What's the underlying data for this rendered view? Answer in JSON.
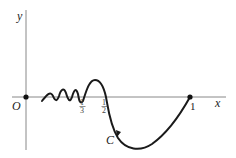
{
  "diagram": {
    "axes": {
      "x_label": "x",
      "y_label": "y",
      "origin_label": "O",
      "axis_color": "#888888"
    },
    "ticks": [
      {
        "num": "1",
        "den": "3"
      },
      {
        "num": "1",
        "den": "2"
      }
    ],
    "point_one_label": "1",
    "curve_label": "C",
    "curve_color": "#1a1a1a"
  }
}
